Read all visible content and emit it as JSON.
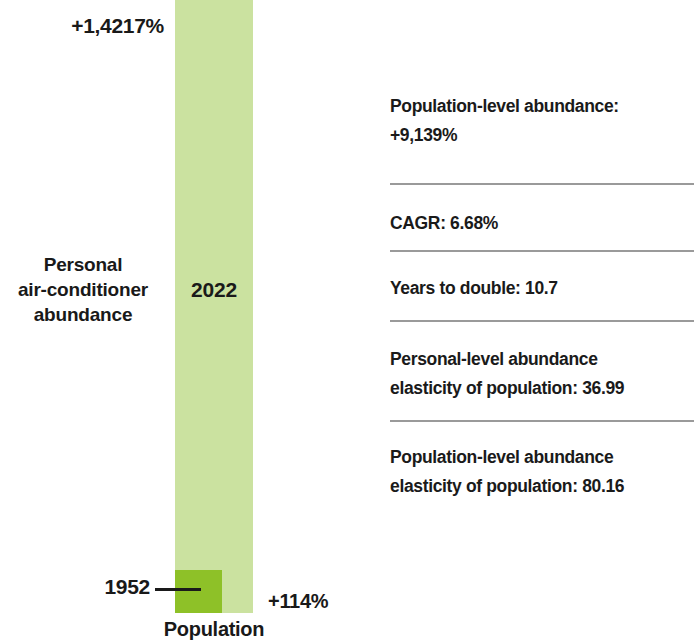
{
  "chart_data": {
    "type": "bar",
    "title": "",
    "xlabel": "Population",
    "ylabel": "",
    "categories": [
      "1952",
      "2022"
    ],
    "series": [
      {
        "name": "Personal air-conditioner abundance",
        "values": [
          114,
          14217
        ],
        "value_labels": [
          "+114%",
          "+1,4217%"
        ]
      }
    ],
    "bar_labels": {
      "bottom": "1952",
      "top": "2022"
    },
    "colors": {
      "bar_1952": "#8ec128",
      "bar_2022": "#cbe2a0",
      "text": "#1a1a1a",
      "divider": "#9a9a9a"
    },
    "grid": false,
    "legend": "none"
  },
  "chart": {
    "top_value_label": "+1,4217%",
    "bottom_value_label": "+114%",
    "bar_2022_label": "2022",
    "bar_1952_label": "1952",
    "series_label_lines": [
      "Personal",
      "air-conditioner",
      "abundance"
    ],
    "axis_label": "Population"
  },
  "stats": {
    "rows": [
      {
        "lines": [
          "Population-level abundance:",
          "+9,139%"
        ]
      },
      {
        "lines": [
          "CAGR: 6.68%"
        ]
      },
      {
        "lines": [
          "Years to double: 10.7"
        ]
      },
      {
        "lines": [
          "Personal-level abundance",
          "elasticity of population: 36.99"
        ]
      },
      {
        "lines": [
          "Population-level abundance",
          "elasticity of population: 80.16"
        ]
      }
    ]
  }
}
